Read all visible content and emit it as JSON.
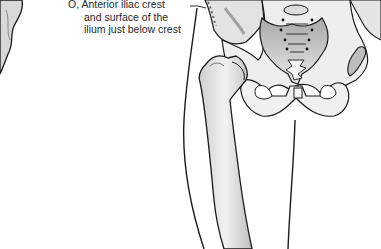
{
  "figure": {
    "annotation": {
      "lines": [
        "O, Anterior iliac crest",
        "and surface of the",
        "ilium just below crest"
      ]
    },
    "colors": {
      "ink": "#1a1a1a",
      "shade": "#9a9a9a",
      "background": "#ffffff"
    }
  }
}
